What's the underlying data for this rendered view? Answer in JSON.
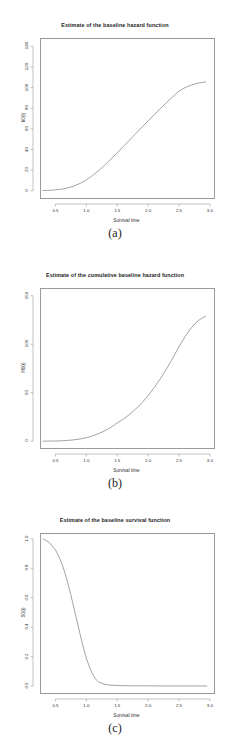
{
  "figure": {
    "background": "#ffffff",
    "line_color": "#7d7d7d",
    "axis_color": "#9a9a9a",
    "panels": [
      {
        "caption": "(a)",
        "chart_data": {
          "type": "line",
          "title": "Estimate of the baseline hazard function",
          "xlabel": "Survival time",
          "ylabel": "h0(t)",
          "xlim": [
            0.25,
            3.05
          ],
          "ylim": [
            -6,
            148
          ],
          "xticks": [
            "0.5",
            "1.0",
            "1.5",
            "2.0",
            "2.5",
            "3.0"
          ],
          "xtickvals": [
            0.5,
            1.0,
            1.5,
            2.0,
            2.5,
            3.0
          ],
          "yticks": [
            "0",
            "20",
            "40",
            "60",
            "80",
            "100",
            "120",
            "140"
          ],
          "ytickvals": [
            0,
            20,
            40,
            60,
            80,
            100,
            120,
            140
          ],
          "grid": false,
          "legend": "none",
          "x": [
            0.3,
            0.4,
            0.5,
            0.6,
            0.7,
            0.8,
            0.9,
            1.0,
            1.1,
            1.2,
            1.3,
            1.4,
            1.5,
            1.6,
            1.7,
            1.8,
            1.9,
            2.0,
            2.1,
            2.2,
            2.3,
            2.4,
            2.5,
            2.6,
            2.7,
            2.8,
            2.93
          ],
          "y": [
            0.3,
            0.5,
            0.9,
            1.6,
            2.8,
            4.6,
            7.2,
            10.6,
            14.8,
            19.6,
            25.0,
            30.8,
            36.8,
            43.0,
            49.2,
            55.4,
            61.6,
            67.8,
            73.8,
            79.8,
            85.6,
            91.2,
            96.6,
            100.0,
            102.5,
            104.2,
            105.5
          ]
        }
      },
      {
        "caption": "(b)",
        "chart_data": {
          "type": "line",
          "title": "Estimate of the cumulative baseline hazard function",
          "xlabel": "Survival time",
          "ylabel": "H0(t)",
          "xlim": [
            0.25,
            3.05
          ],
          "ylim": [
            -6,
            158
          ],
          "xticks": [
            "0.5",
            "1.0",
            "1.5",
            "2.0",
            "2.5",
            "3.0"
          ],
          "xtickvals": [
            0.5,
            1.0,
            1.5,
            2.0,
            2.5,
            3.0
          ],
          "yticks": [
            "0",
            "50",
            "100",
            "150"
          ],
          "ytickvals": [
            0,
            50,
            100,
            150
          ],
          "grid": false,
          "legend": "none",
          "x": [
            0.3,
            0.4,
            0.5,
            0.6,
            0.7,
            0.8,
            0.9,
            1.0,
            1.1,
            1.2,
            1.3,
            1.4,
            1.5,
            1.6,
            1.7,
            1.8,
            1.9,
            2.0,
            2.1,
            2.2,
            2.3,
            2.4,
            2.5,
            2.6,
            2.7,
            2.8,
            2.93
          ],
          "y": [
            0.0,
            0.1,
            0.2,
            0.4,
            0.8,
            1.4,
            2.3,
            3.6,
            5.4,
            7.8,
            10.8,
            14.4,
            18.8,
            22.8,
            27.6,
            33.2,
            39.6,
            47.0,
            55.4,
            64.6,
            74.8,
            85.8,
            97.6,
            108.0,
            117.0,
            124.0,
            129.0
          ]
        }
      },
      {
        "caption": "(c)",
        "chart_data": {
          "type": "line",
          "title": "Estimate of the baseline survival function",
          "xlabel": "Survival time",
          "ylabel": "S0(t)",
          "xlim": [
            0.25,
            3.05
          ],
          "ylim": [
            -0.04,
            1.04
          ],
          "xticks": [
            "0.5",
            "1.0",
            "1.5",
            "2.0",
            "2.5",
            "3.0"
          ],
          "xtickvals": [
            0.5,
            1.0,
            1.5,
            2.0,
            2.5,
            3.0
          ],
          "yticks": [
            "0.0",
            "0.2",
            "0.4",
            "0.6",
            "0.8",
            "1.0"
          ],
          "ytickvals": [
            0.0,
            0.2,
            0.4,
            0.6,
            0.8,
            1.0
          ],
          "grid": false,
          "legend": "none",
          "x": [
            0.3,
            0.4,
            0.5,
            0.55,
            0.6,
            0.65,
            0.7,
            0.75,
            0.8,
            0.85,
            0.9,
            0.95,
            1.0,
            1.05,
            1.1,
            1.15,
            1.2,
            1.3,
            1.4,
            1.6,
            1.8,
            2.0,
            2.2,
            2.4,
            2.6,
            2.8,
            2.95
          ],
          "y": [
            1.0,
            0.975,
            0.925,
            0.885,
            0.835,
            0.775,
            0.7,
            0.62,
            0.53,
            0.44,
            0.35,
            0.265,
            0.19,
            0.13,
            0.082,
            0.048,
            0.028,
            0.012,
            0.006,
            0.003,
            0.002,
            0.002,
            0.001,
            0.001,
            0.001,
            0.001,
            0.001
          ]
        }
      }
    ]
  }
}
